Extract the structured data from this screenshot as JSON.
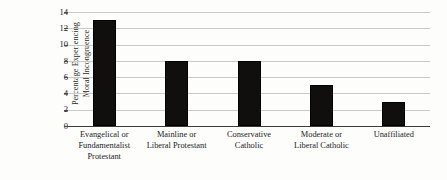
{
  "chart_data": {
    "type": "bar",
    "title": "",
    "subtitle": "",
    "xlabel": "",
    "ylabel": "Percentage Experiencing Moral Incongruence",
    "ylabel_lines": [
      "Percentage Experiencing",
      "Moral Incongruence"
    ],
    "categories": [
      "Evangelical or Fundamentalist Protestant",
      "Mainline or Liberal Protestant",
      "Conservative Catholic",
      "Moderate or Liberal Catholic",
      "Unaffiliated"
    ],
    "category_lines": [
      [
        "Evangelical or",
        "Fundamentalist",
        "Protestant"
      ],
      [
        "Mainline or",
        "Liberal Protestant"
      ],
      [
        "Conservative",
        "Catholic"
      ],
      [
        "Moderate or",
        "Liberal Catholic"
      ],
      [
        "Unaffiliated"
      ]
    ],
    "values": [
      13,
      8,
      8,
      5,
      3
    ],
    "ylim": [
      0,
      14
    ],
    "ytick_values": [
      14,
      12,
      10,
      8,
      6,
      4,
      2,
      0
    ],
    "ytick_labels": [
      "14",
      "12",
      "10",
      "8",
      "6",
      "4",
      "2",
      "0"
    ],
    "grid": true,
    "grid_axis": "y",
    "legend": "none",
    "bar_color": "#100f0e",
    "grid_color": "#c9c9c9",
    "axis_color": "#3a3a38",
    "background_color": "#fdfdfc"
  }
}
